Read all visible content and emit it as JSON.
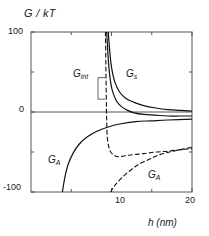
{
  "chart_data": {
    "type": "line",
    "title": "",
    "xlabel": "h (nm)",
    "ylabel": "G / kT",
    "xlim": [
      0,
      20
    ],
    "ylim": [
      -100,
      100
    ],
    "xticks": [
      10,
      20
    ],
    "xtick_labels": [
      "10",
      "20"
    ],
    "yticks": [
      -100,
      0,
      100
    ],
    "ytick_labels": [
      "-100",
      "0",
      "100"
    ],
    "grid": false,
    "legend_position": "inline-annotations",
    "zero_line": true,
    "series": [
      {
        "name": "G_s",
        "label": "G",
        "subscript": "s",
        "style": "solid",
        "description": "Steric repulsion, diverges to +100 near h=9.5 nm and decays toward 0 at large h",
        "points": [
          [
            9.6,
            100
          ],
          [
            9.8,
            74
          ],
          [
            10.0,
            56
          ],
          [
            10.4,
            38
          ],
          [
            11.0,
            25
          ],
          [
            11.8,
            17
          ],
          [
            12.8,
            12
          ],
          [
            14.0,
            8
          ],
          [
            15.5,
            5
          ],
          [
            17.0,
            3
          ],
          [
            18.5,
            2
          ],
          [
            20.0,
            1
          ]
        ]
      },
      {
        "name": "G_int_solid",
        "label": "G",
        "subscript": "int",
        "style": "solid",
        "description": "Total interaction curve, diverges upward near h=9.4 nm and crosses zero, approaching small negative values",
        "points": [
          [
            9.4,
            100
          ],
          [
            9.6,
            66
          ],
          [
            9.8,
            44
          ],
          [
            10.1,
            27
          ],
          [
            10.6,
            14
          ],
          [
            11.2,
            7
          ],
          [
            12.0,
            2
          ],
          [
            12.8,
            -1
          ],
          [
            14.0,
            -3
          ],
          [
            15.5,
            -4
          ],
          [
            17.0,
            -5
          ],
          [
            18.5,
            -5
          ],
          [
            20.0,
            -5
          ]
        ]
      },
      {
        "name": "G_A_solid",
        "label": "G",
        "subscript": "A",
        "style": "solid",
        "description": "Van der Waals attraction, rises from -100 at h=4 nm asymptotically toward small negative values",
        "points": [
          [
            3.9,
            -100
          ],
          [
            4.2,
            -82
          ],
          [
            4.6,
            -66
          ],
          [
            5.2,
            -52
          ],
          [
            6.0,
            -40
          ],
          [
            7.0,
            -31
          ],
          [
            8.2,
            -24
          ],
          [
            9.5,
            -19
          ],
          [
            11.0,
            -15
          ],
          [
            13.0,
            -12
          ],
          [
            15.0,
            -11
          ],
          [
            17.0,
            -10
          ],
          [
            20.0,
            -9
          ]
        ]
      },
      {
        "name": "G_int_dashed",
        "label": "G",
        "subscript": "int",
        "style": "dashed",
        "description": "Dashed total interaction, near-vertical drop at h=9.3 nm to a minimum around -55, then flat",
        "points": [
          [
            9.25,
            100
          ],
          [
            9.3,
            60
          ],
          [
            9.35,
            20
          ],
          [
            9.4,
            -10
          ],
          [
            9.5,
            -34
          ],
          [
            9.8,
            -48
          ],
          [
            10.3,
            -54
          ],
          [
            10.9,
            -56
          ],
          [
            11.5,
            -55
          ],
          [
            12.2,
            -54
          ],
          [
            13.0,
            -53
          ],
          [
            14.0,
            -52
          ],
          [
            15.5,
            -50
          ],
          [
            17.0,
            -49
          ],
          [
            18.6,
            -47
          ],
          [
            20.0,
            -46
          ]
        ]
      },
      {
        "name": "G_A_dashed",
        "label": "G",
        "subscript": "A",
        "style": "dashed",
        "description": "Dashed attraction branch rising from -100 near h=10 nm toward about -45 at h=20 nm",
        "points": [
          [
            9.9,
            -100
          ],
          [
            10.4,
            -92
          ],
          [
            11.2,
            -83
          ],
          [
            12.2,
            -74
          ],
          [
            13.3,
            -66
          ],
          [
            14.5,
            -60
          ],
          [
            15.8,
            -54
          ],
          [
            17.2,
            -50
          ],
          [
            18.6,
            -47
          ],
          [
            20.0,
            -44
          ]
        ]
      }
    ],
    "annotations": [
      {
        "name": "G_int",
        "label": "G",
        "subscript": "int",
        "x": 7.0,
        "y": 43,
        "leader": true
      },
      {
        "name": "G_s",
        "label": "G",
        "subscript": "s",
        "x": 13.6,
        "y": 43,
        "leader": false
      },
      {
        "name": "G_A_left",
        "label": "G",
        "subscript": "A",
        "x": 3.9,
        "y": -44,
        "leader": false
      },
      {
        "name": "G_A_right",
        "label": "G",
        "subscript": "A",
        "x": 16.1,
        "y": -63,
        "leader": false
      }
    ]
  },
  "axes": {
    "y_axis_title": "G / kT",
    "x_axis_title": "h (nm)",
    "y_top_label": "100",
    "y_mid_label": "0",
    "y_bottom_label": "-100",
    "x_tick_1": "10",
    "x_tick_2": "20"
  },
  "labels": {
    "g_int": "G",
    "g_int_sub": "int",
    "g_s": "G",
    "g_s_sub": "s",
    "g_a_left": "G",
    "g_a_left_sub": "A",
    "g_a_right": "G",
    "g_a_right_sub": "A"
  },
  "colors": {
    "axis": "#555555",
    "curve": "#111111",
    "background": "#ffffff"
  }
}
